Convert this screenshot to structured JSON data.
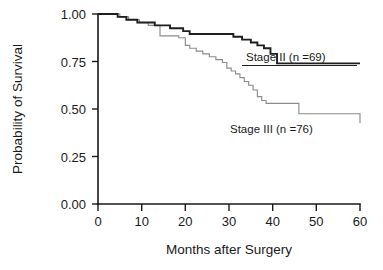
{
  "chart_data": {
    "type": "line",
    "title": "",
    "subtitle": "",
    "xlabel": "Months after Surgery",
    "ylabel": "Probability of Survival",
    "xlim": [
      0,
      60
    ],
    "ylim": [
      0,
      1.0
    ],
    "xticks": [
      0,
      10,
      20,
      30,
      40,
      50,
      60
    ],
    "xtick_labels": [
      "0",
      "10",
      "20",
      "30",
      "40",
      "50",
      "60"
    ],
    "yticks": [
      0.0,
      0.25,
      0.5,
      0.75,
      1.0
    ],
    "ytick_labels": [
      "0.00",
      "0.25",
      "0.50",
      "0.75",
      "1.00"
    ],
    "grid": false,
    "legend_position": "inline-annotation",
    "step_style": "post",
    "series": [
      {
        "name": "Stage II (n =69)",
        "label_text": "Stage II (n =69)",
        "n": 69,
        "stage": "II",
        "color": "#1f1f1f",
        "line_width": 1.9,
        "x": [
          0,
          3.0,
          4.5,
          6.5,
          9.0,
          11.0,
          13.0,
          14.5,
          16.5,
          18.0,
          19.5,
          21.0,
          24.0,
          29.5,
          31.0,
          33.0,
          35.0,
          36.5,
          38.0,
          39.5,
          41.0,
          60.0
        ],
        "y": [
          1.0,
          1.0,
          0.985,
          0.97,
          0.955,
          0.955,
          0.94,
          0.94,
          0.925,
          0.925,
          0.91,
          0.895,
          0.895,
          0.895,
          0.88,
          0.865,
          0.85,
          0.835,
          0.82,
          0.79,
          0.74,
          0.74
        ]
      },
      {
        "name": "Stage III (n =76)",
        "label_text": "Stage III (n =76)",
        "n": 76,
        "stage": "III",
        "color": "#8c8c8c",
        "line_width": 1.15,
        "x": [
          0,
          3.0,
          5.0,
          7.0,
          9.5,
          11.5,
          13.0,
          14.0,
          14.2,
          16.0,
          18.5,
          20.0,
          21.0,
          22.5,
          24.0,
          25.5,
          27.0,
          28.5,
          29.5,
          30.5,
          31.5,
          32.5,
          33.5,
          34.5,
          35.5,
          36.5,
          37.5,
          38.5,
          40.0,
          46.0,
          57.5,
          60.0
        ],
        "y": [
          1.0,
          1.0,
          0.985,
          0.97,
          0.955,
          0.94,
          0.94,
          0.94,
          0.885,
          0.885,
          0.875,
          0.835,
          0.82,
          0.805,
          0.79,
          0.775,
          0.76,
          0.745,
          0.715,
          0.7,
          0.685,
          0.665,
          0.645,
          0.625,
          0.6,
          0.565,
          0.545,
          0.53,
          0.53,
          0.475,
          0.475,
          0.425
        ]
      }
    ],
    "annotations": [
      {
        "id": "stage-2-annotation",
        "text": "Stage II (n =69)",
        "x_px": 247,
        "y_px": 61,
        "leader_from_px": [
          242,
          65
        ],
        "leader_to_px": [
          357,
          65
        ]
      },
      {
        "id": "stage-3-annotation",
        "text": "Stage III (n =76)",
        "x_px": 231,
        "y_px": 130,
        "leader_from_px": [
          0,
          0
        ],
        "leader_to_px": [
          0,
          0
        ]
      }
    ]
  },
  "axes": {
    "x_axis_label": "Months after Surgery",
    "y_axis_label": "Probability of Survival"
  }
}
